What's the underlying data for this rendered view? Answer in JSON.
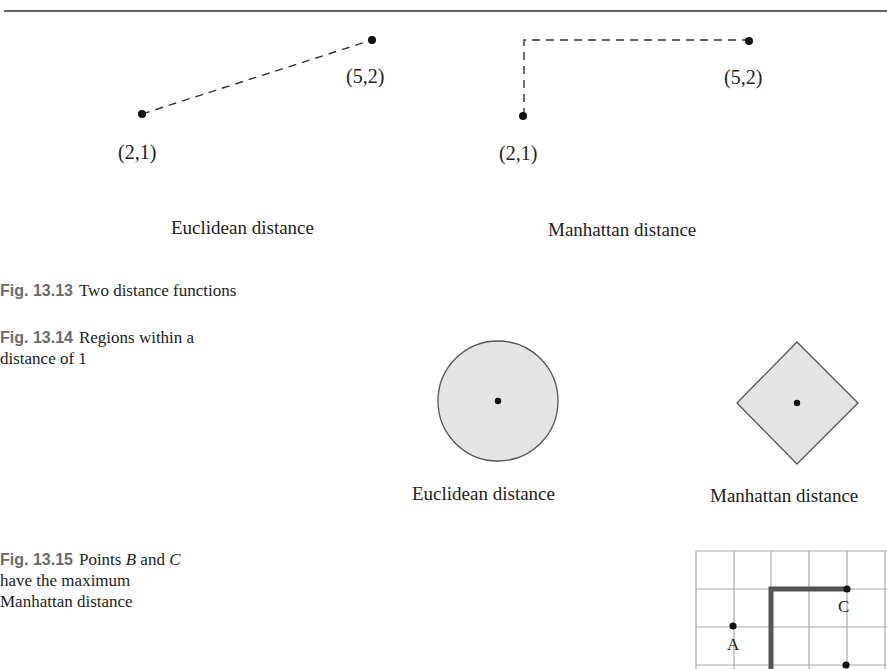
{
  "fig13_13": {
    "caption_label": "Fig. 13.13",
    "caption_text": "Two distance functions",
    "euclidean": {
      "title": "Euclidean distance",
      "point_a_label": "(2,1)",
      "point_b_label": "(5,2)"
    },
    "manhattan": {
      "title": "Manhattan distance",
      "point_a_label": "(2,1)",
      "point_b_label": "(5,2)"
    }
  },
  "fig13_14": {
    "caption_label": "Fig. 13.14",
    "caption_line1": "Regions within a",
    "caption_line2": "distance of 1",
    "euclidean_title": "Euclidean distance",
    "manhattan_title": "Manhattan distance",
    "region_fill": "#e4e4e4",
    "region_stroke": "#555555"
  },
  "fig13_15": {
    "caption_label": "Fig. 13.15",
    "caption_pre": "Points",
    "caption_b": "B",
    "caption_and": "and",
    "caption_c": "C",
    "caption_line2": "have the maximum",
    "caption_line3": "Manhattan distance",
    "point_a_label": "A",
    "point_c_label": "C"
  },
  "colors": {
    "caption_label": "#6b6b6b",
    "text": "#222222",
    "grid": "#aaaaaa",
    "path": "#555555"
  }
}
